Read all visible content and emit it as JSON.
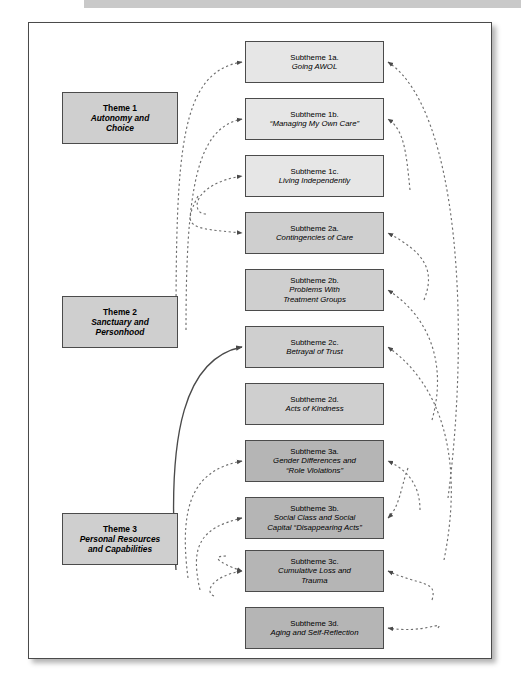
{
  "figure": {
    "type": "thematic-map-diagram",
    "colors": {
      "frame_border": "#4a4a4a",
      "box_border": "#4b4b4b",
      "tone_light": "#e6e6e6",
      "tone_medium": "#cfcfcf",
      "tone_dark": "#b5b5b5",
      "top_band": "#c9c9c9",
      "link_line": "#6e6e6e"
    }
  },
  "themes": [
    {
      "id": "theme-1",
      "title": "Theme 1",
      "subtitle": "Autonomy and Choice",
      "subtitle_lines": [
        "Autonomy and",
        "Choice"
      ],
      "top": 92,
      "height": 52
    },
    {
      "id": "theme-2",
      "title": "Theme 2",
      "subtitle": "Sanctuary and Personhood",
      "subtitle_lines": [
        "Sanctuary and",
        "Personhood"
      ],
      "top": 296,
      "height": 52
    },
    {
      "id": "theme-3",
      "title": "Theme 3",
      "subtitle": "Personal Resources and Capabilities",
      "subtitle_lines": [
        "Personal Resources",
        "and Capabilities"
      ],
      "top": 513,
      "height": 52
    }
  ],
  "subthemes": [
    {
      "id": "1a",
      "title": "Subtheme 1a.",
      "desc": "Going AWOL",
      "desc_lines": [
        "Going AWOL"
      ],
      "top": 41,
      "tone": "tone-a"
    },
    {
      "id": "1b",
      "title": "Subtheme 1b.",
      "desc": "“Managing My Own Care”",
      "desc_lines": [
        "“Managing My Own Care”"
      ],
      "top": 98,
      "tone": "tone-a"
    },
    {
      "id": "1c",
      "title": "Subtheme 1c.",
      "desc": "Living Independently",
      "desc_lines": [
        "Living Independently"
      ],
      "top": 155,
      "tone": "tone-a"
    },
    {
      "id": "2a",
      "title": "Subtheme 2a.",
      "desc": "Contingencies of Care",
      "desc_lines": [
        "Contingencies of Care"
      ],
      "top": 212,
      "tone": "tone-b"
    },
    {
      "id": "2b",
      "title": "Subtheme 2b.",
      "desc": "Problems With Treatment Groups",
      "desc_lines": [
        "Problems With",
        "Treatment Groups"
      ],
      "top": 269,
      "tone": "tone-b"
    },
    {
      "id": "2c",
      "title": "Subtheme 2c.",
      "desc": "Betrayal of Trust",
      "desc_lines": [
        "Betrayal of Trust"
      ],
      "top": 326,
      "tone": "tone-b"
    },
    {
      "id": "2d",
      "title": "Subtheme 2d.",
      "desc": "Acts of Kindness",
      "desc_lines": [
        "Acts of Kindness"
      ],
      "top": 383,
      "tone": "tone-b"
    },
    {
      "id": "3a",
      "title": "Subtheme 3a.",
      "desc": "Gender Differences and “Role Violations”",
      "desc_lines": [
        "Gender Differences and",
        "“Role Violations”"
      ],
      "top": 440,
      "tone": "tone-c"
    },
    {
      "id": "3b",
      "title": "Subtheme 3b.",
      "desc": "Social Class and Social Capital “Disappearing Acts”",
      "desc_lines": [
        "Social Class and Social",
        "Capital “Disappearing Acts”"
      ],
      "top": 497,
      "tone": "tone-c"
    },
    {
      "id": "3c",
      "title": "Subtheme 3c.",
      "desc": "Cumulative Loss and Trauma",
      "desc_lines": [
        "Cumulative Loss and",
        "Trauma"
      ],
      "top": 550,
      "tone": "tone-c"
    },
    {
      "id": "3d",
      "title": "Subtheme 3d.",
      "desc": "Aging and Self-Reflection",
      "desc_lines": [
        "Aging and Self-Reflection"
      ],
      "top": 607,
      "tone": "tone-c"
    }
  ],
  "links": {
    "left_side": [
      {
        "from": "theme-1-area",
        "to": "1a",
        "style": "dashed"
      },
      {
        "from": "theme-1-area",
        "to": "1b",
        "style": "dashed"
      },
      {
        "from": "theme-1-area",
        "to": "1c",
        "style": "dashed"
      },
      {
        "from": "theme-1-area",
        "to": "2a",
        "style": "dashed"
      },
      {
        "from": "theme-3-area",
        "to": "2c",
        "style": "solid"
      },
      {
        "from": "theme-3-area",
        "to": "3a",
        "style": "dashed"
      },
      {
        "from": "theme-3-area",
        "to": "3b",
        "style": "dashed"
      },
      {
        "from": "theme-3-area",
        "to": "3c",
        "style": "dashed"
      }
    ],
    "right_side": [
      {
        "from": "lower-column",
        "to": "1a",
        "style": "dashed"
      },
      {
        "from": "lower-column",
        "to": "1b",
        "style": "dashed"
      },
      {
        "from": "lower-column",
        "to": "2a",
        "style": "dashed"
      },
      {
        "from": "lower-column",
        "to": "2b",
        "style": "dashed"
      },
      {
        "from": "lower-column",
        "to": "2c",
        "style": "dashed"
      },
      {
        "from": "lower-column",
        "to": "3a",
        "style": "dashed"
      },
      {
        "from": "lower-column",
        "to": "3b",
        "style": "dashed"
      },
      {
        "from": "lower-column",
        "to": "3c",
        "style": "dashed"
      },
      {
        "from": "lower-column",
        "to": "3d",
        "style": "dashed"
      }
    ]
  }
}
